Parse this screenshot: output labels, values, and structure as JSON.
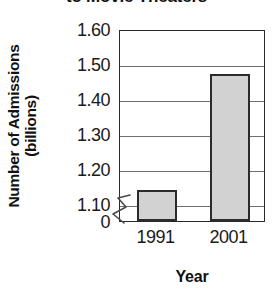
{
  "chart_data": {
    "type": "bar",
    "title": "to Movie Theaters",
    "xlabel": "Year",
    "ylabel_line1": "Number of Admissions",
    "ylabel_line2": "(billions)",
    "categories": [
      "1991",
      "2001"
    ],
    "values": [
      1.14,
      1.47
    ],
    "ylim": [
      1.05,
      1.6
    ],
    "yticks": [
      "1.60",
      "1.50",
      "1.40",
      "1.30",
      "1.20",
      "1.10",
      "0"
    ],
    "ytick_values": [
      1.6,
      1.5,
      1.4,
      1.3,
      1.2,
      1.1,
      0
    ],
    "grid": true,
    "legend": "none",
    "axis_break": true,
    "axis_break_note": "y-axis broken between 0 and 1.10",
    "bar_fill_color": "#d2d2d2",
    "bar_edge_color": "#2b2b2b",
    "gridline_color": "#6f6f6f",
    "axis_color": "#2a2a2a"
  }
}
